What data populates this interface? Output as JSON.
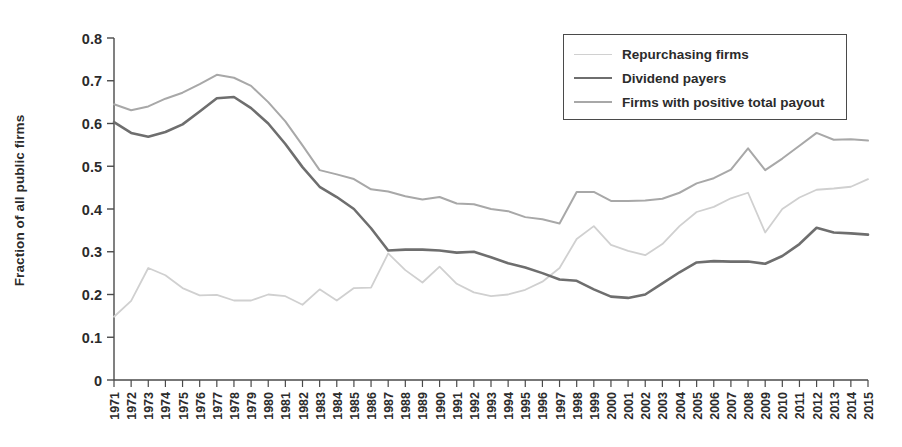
{
  "chart_data": {
    "type": "line",
    "title": "",
    "xlabel": "",
    "ylabel": "Fraction of all public firms",
    "xlim": [
      1971,
      2015
    ],
    "ylim": [
      0,
      0.8
    ],
    "ytick_labels": [
      "0",
      "0.1",
      "0.2",
      "0.3",
      "0.4",
      "0.5",
      "0.6",
      "0.7",
      "0.8"
    ],
    "ytick_values": [
      0,
      0.1,
      0.2,
      0.3,
      0.4,
      0.5,
      0.6,
      0.7,
      0.8
    ],
    "grid": false,
    "legend_position": "top-right",
    "x": [
      1971,
      1972,
      1973,
      1974,
      1975,
      1976,
      1977,
      1978,
      1979,
      1980,
      1981,
      1982,
      1983,
      1984,
      1985,
      1986,
      1987,
      1988,
      1989,
      1990,
      1991,
      1992,
      1993,
      1994,
      1995,
      1996,
      1997,
      1998,
      1999,
      2000,
      2001,
      2002,
      2003,
      2004,
      2005,
      2006,
      2007,
      2008,
      2009,
      2010,
      2011,
      2012,
      2013,
      2014,
      2015
    ],
    "categories": [
      "1971",
      "1972",
      "1973",
      "1974",
      "1975",
      "1976",
      "1977",
      "1978",
      "1979",
      "1980",
      "1981",
      "1982",
      "1983",
      "1984",
      "1985",
      "1986",
      "1987",
      "1988",
      "1989",
      "1990",
      "1991",
      "1992",
      "1993",
      "1994",
      "1995",
      "1996",
      "1997",
      "1998",
      "1999",
      "2000",
      "2001",
      "2002",
      "2003",
      "2004",
      "2005",
      "2006",
      "2007",
      "2008",
      "2009",
      "2010",
      "2011",
      "2012",
      "2013",
      "2014",
      "2015"
    ],
    "series": [
      {
        "name": "Repurchasing firms",
        "color": "#d0d0d0",
        "width": 1.8,
        "values": [
          0.148,
          0.185,
          0.262,
          0.245,
          0.215,
          0.198,
          0.199,
          0.186,
          0.186,
          0.2,
          0.196,
          0.176,
          0.212,
          0.186,
          0.215,
          0.216,
          0.296,
          0.257,
          0.228,
          0.265,
          0.225,
          0.205,
          0.196,
          0.2,
          0.211,
          0.23,
          0.262,
          0.33,
          0.36,
          0.316,
          0.302,
          0.292,
          0.318,
          0.36,
          0.393,
          0.405,
          0.425,
          0.438,
          0.345,
          0.4,
          0.427,
          0.445,
          0.448,
          0.452,
          0.47
        ]
      },
      {
        "name": "Dividend payers",
        "color": "#6e6e6e",
        "width": 2.6,
        "values": [
          0.603,
          0.578,
          0.569,
          0.58,
          0.598,
          0.628,
          0.659,
          0.662,
          0.636,
          0.6,
          0.552,
          0.498,
          0.452,
          0.428,
          0.4,
          0.355,
          0.303,
          0.305,
          0.305,
          0.303,
          0.298,
          0.3,
          0.287,
          0.273,
          0.263,
          0.25,
          0.235,
          0.232,
          0.212,
          0.195,
          0.192,
          0.2,
          0.226,
          0.252,
          0.275,
          0.278,
          0.277,
          0.277,
          0.272,
          0.29,
          0.318,
          0.356,
          0.345,
          0.343,
          0.34
        ]
      },
      {
        "name": "Firms with positive total payout",
        "color": "#a8a8a8",
        "width": 2.0,
        "values": [
          0.645,
          0.631,
          0.64,
          0.658,
          0.672,
          0.692,
          0.714,
          0.707,
          0.688,
          0.65,
          0.605,
          0.549,
          0.491,
          0.481,
          0.47,
          0.446,
          0.441,
          0.43,
          0.422,
          0.428,
          0.413,
          0.411,
          0.4,
          0.395,
          0.381,
          0.376,
          0.366,
          0.44,
          0.44,
          0.419,
          0.419,
          0.42,
          0.424,
          0.438,
          0.46,
          0.472,
          0.492,
          0.542,
          0.491,
          0.518,
          0.548,
          0.578,
          0.562,
          0.563,
          0.56
        ]
      }
    ]
  },
  "axis": {
    "ylabel": "Fraction of all public firms"
  },
  "legend": {
    "items": [
      {
        "label": "Repurchasing firms",
        "color": "#d0d0d0",
        "width": 1.8
      },
      {
        "label": "Dividend payers",
        "color": "#6e6e6e",
        "width": 2.6
      },
      {
        "label": "Firms with positive total payout",
        "color": "#a8a8a8",
        "width": 2.0
      }
    ]
  }
}
